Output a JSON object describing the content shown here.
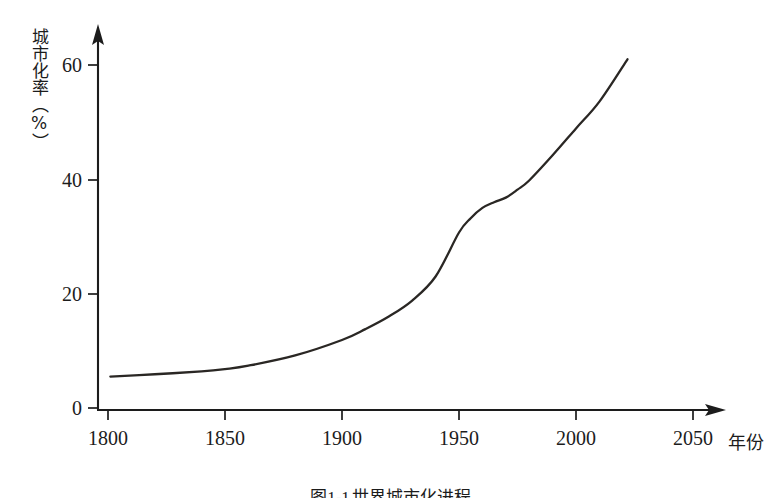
{
  "chart_data": {
    "type": "line",
    "xlabel": "年份",
    "ylabel": "城市化率（%）",
    "xlim": [
      1790,
      2062
    ],
    "ylim": [
      0,
      64
    ],
    "grid": false,
    "legend": null,
    "xticks": [
      1800,
      1850,
      1900,
      1950,
      2000,
      2050
    ],
    "xtick_labels": [
      "1800",
      "1850",
      "1900",
      "1950",
      "2000",
      "2050"
    ],
    "yticks": [
      0,
      20,
      40,
      60
    ],
    "ytick_labels": [
      "0",
      "20",
      "40",
      "60"
    ],
    "series": [
      {
        "name": "世界城市化率",
        "x": [
          1801,
          1820,
          1840,
          1850,
          1860,
          1880,
          1900,
          1910,
          1920,
          1930,
          1940,
          1950,
          1955,
          1960,
          1965,
          1970,
          1975,
          1980,
          1990,
          2000,
          2010,
          2022
        ],
        "values": [
          5.5,
          5.9,
          6.4,
          6.8,
          7.4,
          9.2,
          11.9,
          13.8,
          16.0,
          18.8,
          23.0,
          30.7,
          33.2,
          35.0,
          36.0,
          36.8,
          38.2,
          39.8,
          44.2,
          48.9,
          53.6,
          61.0
        ]
      }
    ],
    "annotations": []
  },
  "axis_titles": {
    "y": "城市化率（%）",
    "x": "年份"
  },
  "caption": {
    "number": "图1-1",
    "text": "世界城市化进程"
  },
  "colors": {
    "curve": "#2a2724",
    "axis": "#1c1c1c",
    "background": "#ffffff"
  }
}
